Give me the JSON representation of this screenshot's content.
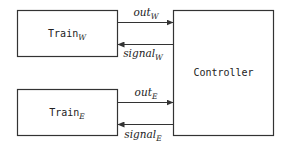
{
  "diagram": {
    "nodes": [
      {
        "id": "train_w",
        "label": "Train",
        "subscript": "W"
      },
      {
        "id": "train_e",
        "label": "Train",
        "subscript": "E"
      },
      {
        "id": "controller",
        "label": "Controller",
        "subscript": ""
      }
    ],
    "edges": [
      {
        "id": "out_w",
        "from": "train_w",
        "to": "controller",
        "label": "out",
        "subscript": "W"
      },
      {
        "id": "signal_w",
        "from": "controller",
        "to": "train_w",
        "label": "signal",
        "subscript": "W"
      },
      {
        "id": "out_e",
        "from": "train_e",
        "to": "controller",
        "label": "out",
        "subscript": "E"
      },
      {
        "id": "signal_e",
        "from": "controller",
        "to": "train_e",
        "label": "signal",
        "subscript": "E"
      }
    ],
    "colors": {
      "stroke": "#333333",
      "text": "#222222",
      "background": "#ffffff"
    }
  }
}
